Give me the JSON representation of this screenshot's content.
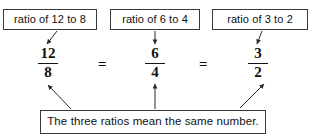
{
  "diagram": {
    "background_color": "#ffffff",
    "ink_color": "#111111",
    "border_color": "#3a3a3a",
    "top_labels": [
      {
        "text": "ratio of 12 to 8"
      },
      {
        "text": "ratio of 6 to 4"
      },
      {
        "text": "ratio of 3 to 2"
      }
    ],
    "fractions": [
      {
        "numerator": "12",
        "denominator": "8"
      },
      {
        "numerator": "6",
        "denominator": "4"
      },
      {
        "numerator": "3",
        "denominator": "2"
      }
    ],
    "operators": [
      {
        "symbol": "="
      },
      {
        "symbol": "="
      }
    ],
    "caption": {
      "text": "The three ratios mean the same number."
    },
    "arrows": {
      "from_label_1": "points down-left to the fraction 12/8",
      "from_label_2": "points straight down to the fraction 6/4",
      "from_label_3": "points down-left to the fraction 3/2",
      "to_fraction_1": "points up-left from the caption to the fraction 12/8",
      "to_fraction_2": "points straight up from the caption to the fraction 6/4",
      "to_fraction_3": "points up-right from the caption to the fraction 3/2"
    }
  }
}
